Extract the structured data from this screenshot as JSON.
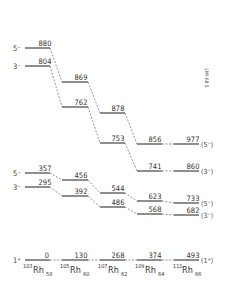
{
  "diagram": {
    "title_code": "LMI-68.5",
    "nuclei": [
      {
        "mass": "103",
        "symbol": "Rh",
        "neutrons": "58"
      },
      {
        "mass": "105",
        "symbol": "Rh",
        "neutrons": "60"
      },
      {
        "mass": "107",
        "symbol": "Rh",
        "neutrons": "62"
      },
      {
        "mass": "109",
        "symbol": "Rh",
        "neutrons": "64"
      },
      {
        "mass": "111",
        "symbol": "Rh",
        "neutrons": "66"
      }
    ],
    "bands": [
      {
        "spin_label": "5⁻",
        "energies": [
          "880",
          "869",
          "878",
          "856",
          "977"
        ],
        "tentative_label": "(5⁻)"
      },
      {
        "spin_label": "3⁻",
        "energies": [
          "804",
          "762",
          "753",
          "741",
          "860"
        ],
        "tentative_label": "(3⁻)"
      },
      {
        "spin_label": "5⁻",
        "energies": [
          "357",
          "456",
          "544",
          "623",
          "733"
        ],
        "tentative_label": "(5⁻)"
      },
      {
        "spin_label": "3⁻",
        "energies": [
          "295",
          "392",
          "486",
          "568",
          "682"
        ],
        "tentative_label": "(3⁻)"
      },
      {
        "spin_label": "1⁺",
        "energies": [
          "0",
          "130",
          "268",
          "374",
          "493"
        ],
        "tentative_label": "(1⁺)"
      }
    ]
  }
}
